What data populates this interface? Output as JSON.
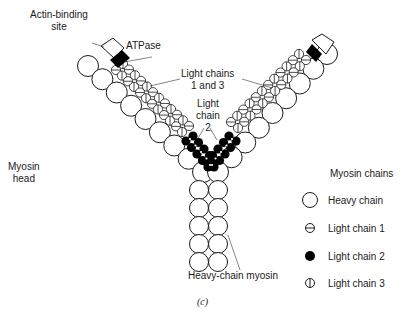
{
  "figure": {
    "caption": "(c)",
    "labels": {
      "actin_binding_site": "Actin-binding\nsite",
      "atpase": "ATPase",
      "light_chains_1_3": "Light chains\n1 and 3",
      "light_chain_2": "Light\nchain\n2",
      "myosin_head": "Myosin\nhead",
      "heavy_chain_myosin": "Heavy-chain myosin"
    },
    "legend": {
      "title": "Myosin chains",
      "items": [
        {
          "symbol": "open-circle",
          "label": "Heavy chain"
        },
        {
          "symbol": "circle-horizontal-bar",
          "label": "Light chain 1"
        },
        {
          "symbol": "filled-circle",
          "label": "Light chain 2"
        },
        {
          "symbol": "circle-vertical-bar",
          "label": "Light chain 3"
        }
      ]
    },
    "colors": {
      "ink": "#1a1a1a",
      "fill": "#ffffff",
      "dark": "#000000"
    }
  }
}
